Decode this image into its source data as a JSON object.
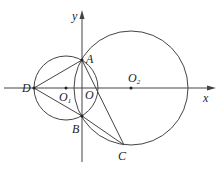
{
  "figure": {
    "type": "geometry",
    "axes": {
      "x_label": "x",
      "y_label": "y"
    },
    "points": {
      "A": {
        "label": "A"
      },
      "B": {
        "label": "B"
      },
      "C": {
        "label": "C"
      },
      "D": {
        "label": "D"
      },
      "O": {
        "label": "O"
      },
      "O1": {
        "label": "O",
        "sub": "1"
      },
      "O2": {
        "label": "O",
        "sub": "2"
      }
    },
    "segments": [
      "DA",
      "DB",
      "AC",
      "BC"
    ],
    "circles": [
      "circle O1 (through D, A, B)",
      "circle O2 (through A, B, C)"
    ],
    "colors": {
      "line": "#444444",
      "text": "#222222",
      "background": "#ffffff"
    }
  }
}
